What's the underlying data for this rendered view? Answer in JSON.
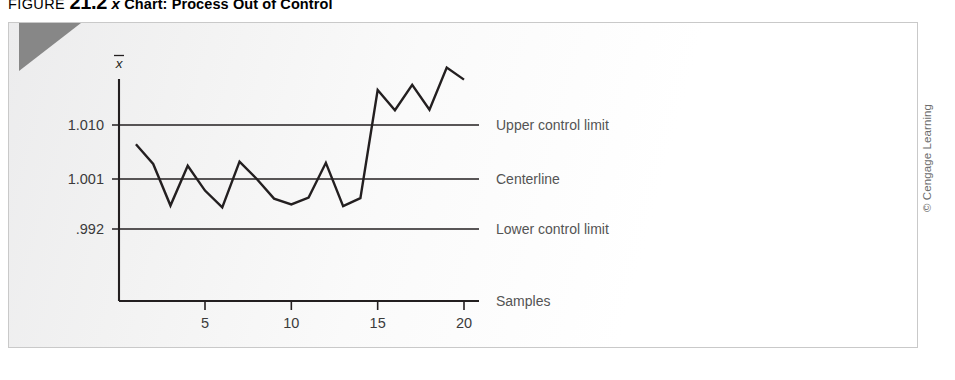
{
  "caption": {
    "figure_word": "FIGURE",
    "figure_number": "21.2",
    "xbar_symbol": "x",
    "title": "Chart: Process Out of Control"
  },
  "copyright": "© Cengage Learning",
  "chart_data": {
    "type": "line",
    "title": "",
    "xlabel": "Samples",
    "ylabel": "x̄",
    "x": [
      1,
      2,
      3,
      4,
      5,
      6,
      7,
      8,
      9,
      10,
      11,
      12,
      13,
      14,
      15,
      16,
      17,
      18,
      19,
      20
    ],
    "values": [
      1.007,
      1.0036,
      0.9964,
      1.0033,
      0.999,
      0.9961,
      1.004,
      1.001,
      0.9976,
      0.9966,
      0.9978,
      1.0038,
      0.9963,
      0.9977,
      1.0164,
      1.0129,
      1.0173,
      1.013,
      1.0203,
      1.0182
    ],
    "series": [
      {
        "name": "Sample mean",
        "values": [
          1.007,
          1.0036,
          0.9964,
          1.0033,
          0.999,
          0.9961,
          1.004,
          1.001,
          0.9976,
          0.9966,
          0.9978,
          1.0038,
          0.9963,
          0.9977,
          1.0164,
          1.0129,
          1.0173,
          1.013,
          1.0203,
          1.0182
        ]
      }
    ],
    "xlim": [
      0,
      21
    ],
    "ylim": [
      0.9855,
      1.0235
    ],
    "xticks": [
      5,
      10,
      15,
      20
    ],
    "xticklabels": [
      "5",
      "10",
      "15",
      "20"
    ],
    "yticks": [
      1.01,
      1.001,
      0.992
    ],
    "yticklabels": [
      "1.010",
      "1.001",
      ".992"
    ],
    "grid": false,
    "legend": "none",
    "control_lines": [
      {
        "name": "upper-control-limit",
        "label": "Upper control limit",
        "value": 1.01,
        "tick_label": "1.010"
      },
      {
        "name": "centerline",
        "label": "Centerline",
        "value": 1.001,
        "tick_label": "1.001"
      },
      {
        "name": "lower-control-limit",
        "label": "Lower control limit",
        "value": 0.992,
        "tick_label": ".992"
      }
    ],
    "axis_label_right": "Samples",
    "annotations": [
      "Upper control limit",
      "Centerline",
      "Lower control limit",
      "Samples"
    ],
    "colors": {
      "series_line": "#231f20",
      "control_line": "#231f20",
      "axis": "#231f20",
      "text": "#4f4f4f",
      "plate_border": "#c9c9c9",
      "corner_tab": "#878787"
    }
  }
}
